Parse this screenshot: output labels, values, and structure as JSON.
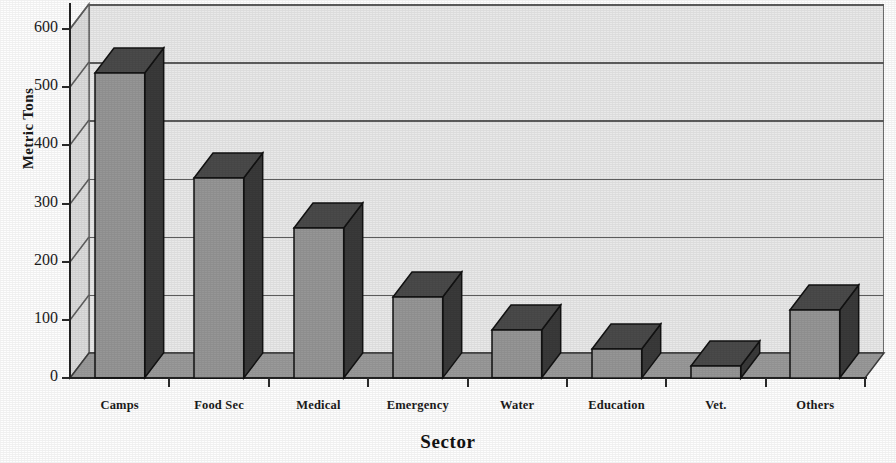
{
  "chart_data": {
    "type": "bar",
    "title": "",
    "subtitle": "",
    "xlabel": "Sector",
    "ylabel": "Metric Tons",
    "categories": [
      "Camps",
      "Food Sec",
      "Medical",
      "Emergency",
      "Water",
      "Education",
      "Vet.",
      "Others"
    ],
    "values": [
      524,
      344,
      258,
      139,
      82,
      50,
      21,
      117
    ],
    "ylim": [
      0,
      600
    ],
    "ytick_labels": [
      "0",
      "100",
      "200",
      "300",
      "400",
      "500",
      "600"
    ],
    "ytick_values": [
      0,
      100,
      200,
      300,
      400,
      500,
      600
    ],
    "grid": "horizontal",
    "legend": "none",
    "style": "3d-column",
    "colors": {
      "bar_front": "#969696",
      "bar_side": "#3a3a3a",
      "bar_top": "#4a4a4a",
      "back_wall": "#e9e9e9",
      "floor": "#9a9a9a",
      "left_wall": "#dcdcdc",
      "gridline": "#5d5d5d",
      "axis": "#232323",
      "text": "#1a1a1a"
    }
  },
  "axis": {
    "y_title": "Metric Tons",
    "x_title": "Sector"
  }
}
